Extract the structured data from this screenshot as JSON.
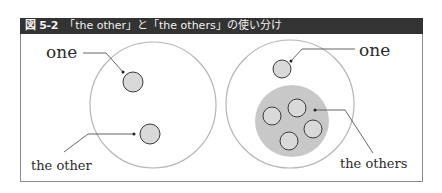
{
  "header": {
    "figure_number": "図 5-2",
    "title": "「the other」と「the others」の使い分け"
  },
  "left_panel": {
    "label_one": "one",
    "label_other": "the other"
  },
  "right_panel": {
    "label_one": "one",
    "label_others": "the others"
  },
  "colors": {
    "header_bg": "#333333",
    "header_text": "#f2f2f2",
    "big_circle_stroke": "#b5b5b5",
    "small_circle_fill": "#d9d9d9",
    "group_fill": "#c8c8c8",
    "leader_line": "#555555"
  }
}
